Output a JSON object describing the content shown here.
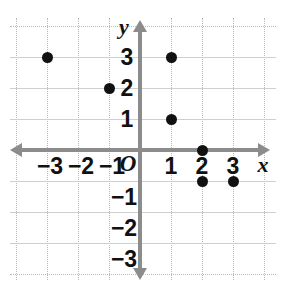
{
  "chart_data": {
    "type": "scatter",
    "title": "",
    "xlabel": "x",
    "ylabel": "y",
    "xlim": [
      -3.9,
      3.9
    ],
    "ylim": [
      -3.9,
      3.9
    ],
    "grid": true,
    "legend": false,
    "origin_label": "O",
    "x_ticks": [
      -3,
      -2,
      -1,
      1,
      2,
      3
    ],
    "y_ticks": [
      3,
      2,
      1,
      -1,
      -2,
      -3
    ],
    "x_tick_labels": [
      "−3",
      "−2",
      "−1",
      "1",
      "2",
      "3"
    ],
    "y_tick_labels": [
      "3",
      "2",
      "1",
      "−1",
      "−2",
      "−3"
    ],
    "points": [
      {
        "x": -3,
        "y": 3
      },
      {
        "x": -1,
        "y": 2
      },
      {
        "x": 1,
        "y": 3
      },
      {
        "x": 1,
        "y": 1
      },
      {
        "x": 2,
        "y": 0
      },
      {
        "x": 2,
        "y": -1
      },
      {
        "x": 3,
        "y": -1
      }
    ],
    "colors": {
      "point": "#111111",
      "axis": "#8c8c8c",
      "grid": "#b9b9b9",
      "background": "#ffffff",
      "label": "#111111"
    }
  }
}
